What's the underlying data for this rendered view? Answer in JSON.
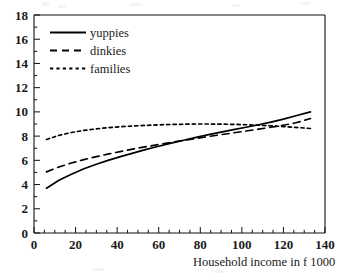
{
  "chart_data": {
    "type": "line",
    "title": "",
    "xlabel": "Household income in f 1000",
    "ylabel": "",
    "xlim": [
      0,
      140
    ],
    "ylim": [
      0,
      18
    ],
    "xticks": [
      "0",
      "20",
      "40",
      "60",
      "80",
      "100",
      "120",
      "140"
    ],
    "yticks": [
      "0",
      "2",
      "4",
      "6",
      "8",
      "10",
      "12",
      "14",
      "16",
      "18"
    ],
    "xtick_values": [
      0,
      20,
      40,
      60,
      80,
      100,
      120,
      140
    ],
    "ytick_values": [
      0,
      2,
      4,
      6,
      8,
      10,
      12,
      14,
      16,
      18
    ],
    "xminor_step": 5,
    "yminor_step": 1,
    "grid": false,
    "legend_position": "upper-left-inside",
    "x": [
      6,
      12,
      18,
      24,
      30,
      36,
      42,
      48,
      54,
      60,
      66,
      72,
      78,
      84,
      90,
      96,
      102,
      108,
      114,
      120,
      126,
      133
    ],
    "series": [
      {
        "name": "yuppies",
        "style": "solid",
        "values": [
          3.7,
          4.35,
          4.85,
          5.3,
          5.68,
          6.02,
          6.33,
          6.62,
          6.9,
          7.16,
          7.42,
          7.66,
          7.9,
          8.12,
          8.33,
          8.53,
          8.73,
          8.94,
          9.16,
          9.4,
          9.68,
          10.0
        ]
      },
      {
        "name": "dinkies",
        "style": "long-dash",
        "values": [
          5.05,
          5.45,
          5.78,
          6.06,
          6.3,
          6.53,
          6.74,
          6.94,
          7.13,
          7.31,
          7.48,
          7.65,
          7.81,
          7.97,
          8.12,
          8.27,
          8.42,
          8.57,
          8.73,
          8.9,
          9.1,
          9.45
        ]
      },
      {
        "name": "families",
        "style": "short-dash",
        "values": [
          7.72,
          8.06,
          8.3,
          8.47,
          8.6,
          8.7,
          8.78,
          8.84,
          8.89,
          8.93,
          8.96,
          8.98,
          9.0,
          9.0,
          8.99,
          8.97,
          8.94,
          8.9,
          8.85,
          8.79,
          8.72,
          8.63
        ]
      }
    ]
  },
  "legend": {
    "items": [
      {
        "label": "yuppies",
        "style": "solid"
      },
      {
        "label": "dinkies",
        "style": "long-dash"
      },
      {
        "label": "families",
        "style": "short-dash"
      }
    ]
  },
  "axis": {
    "x_title": "Household income in f 1000"
  },
  "colors": {
    "line": "#000000",
    "axis": "#111111",
    "background": "#ffffff"
  }
}
